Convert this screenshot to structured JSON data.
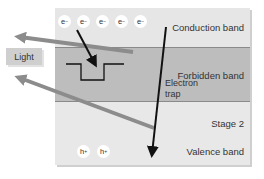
{
  "diagram": {
    "bands": {
      "conduction": {
        "label": "Conduction band",
        "color": "#e6e6e6"
      },
      "forbidden": {
        "label": "Forbidden band",
        "color": "#bdbdbd"
      },
      "stage": {
        "label": "Stage 2"
      },
      "valence": {
        "label": "Valence band",
        "color": "#e8e8e8"
      }
    },
    "electrons": [
      {
        "symbol": "e",
        "charge": "−"
      },
      {
        "symbol": "e",
        "charge": "−"
      },
      {
        "symbol": "e",
        "charge": "−"
      },
      {
        "symbol": "e",
        "charge": "−"
      },
      {
        "symbol": "e",
        "charge": "−"
      }
    ],
    "holes": [
      {
        "symbol": "h",
        "charge": "+"
      },
      {
        "symbol": "h",
        "charge": "+"
      }
    ],
    "trap": {
      "line1": "Electron",
      "line2": "trap"
    },
    "light": {
      "label": "Light"
    },
    "colors": {
      "arrow_black": "#111111",
      "arrow_gray": "#8c8c8c"
    }
  }
}
